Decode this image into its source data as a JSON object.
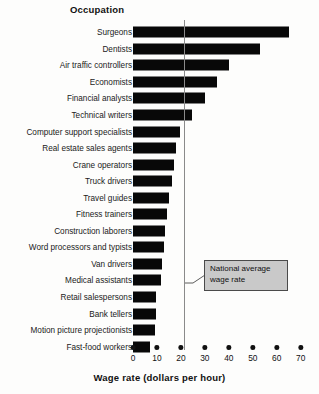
{
  "chart_data": {
    "type": "bar",
    "orientation": "horizontal",
    "title": "Occupation",
    "xlabel": "Wage rate (dollars per hour)",
    "ylabel": "Occupation",
    "xlim": [
      0,
      70
    ],
    "xticks": [
      0,
      10,
      20,
      30,
      40,
      50,
      60,
      70
    ],
    "grid": false,
    "legend": null,
    "categories": [
      "Surgeons",
      "Dentists",
      "Air traffic controllers",
      "Economists",
      "Financial analysts",
      "Technical writers",
      "Computer support specialists",
      "Real estate sales agents",
      "Crane operators",
      "Truck drivers",
      "Travel guides",
      "Fitness trainers",
      "Construction laborers",
      "Word processors and typists",
      "Van drivers",
      "Medical assistants",
      "Retail salespersons",
      "Bank tellers",
      "Motion picture projectionists",
      "Fast-food workers"
    ],
    "values": [
      65,
      53,
      40,
      35,
      30,
      24.5,
      19.5,
      17.8,
      17,
      16.3,
      15,
      14,
      13.4,
      13,
      12.2,
      11.7,
      9.7,
      9.5,
      9.2,
      7
    ],
    "annotations": [
      {
        "name": "national-average-wage-rate",
        "text_line1": "National average",
        "text_line2": "wage rate",
        "value": 21.5,
        "type": "vertical-reference-line"
      }
    ],
    "colors": {
      "bar": "#080808",
      "reference_line": "#8a8a8a",
      "callout_fill": "#c9c9c9",
      "callout_border": "#4a4a4a",
      "background": "#fdfdfc",
      "text": "#111111"
    }
  }
}
